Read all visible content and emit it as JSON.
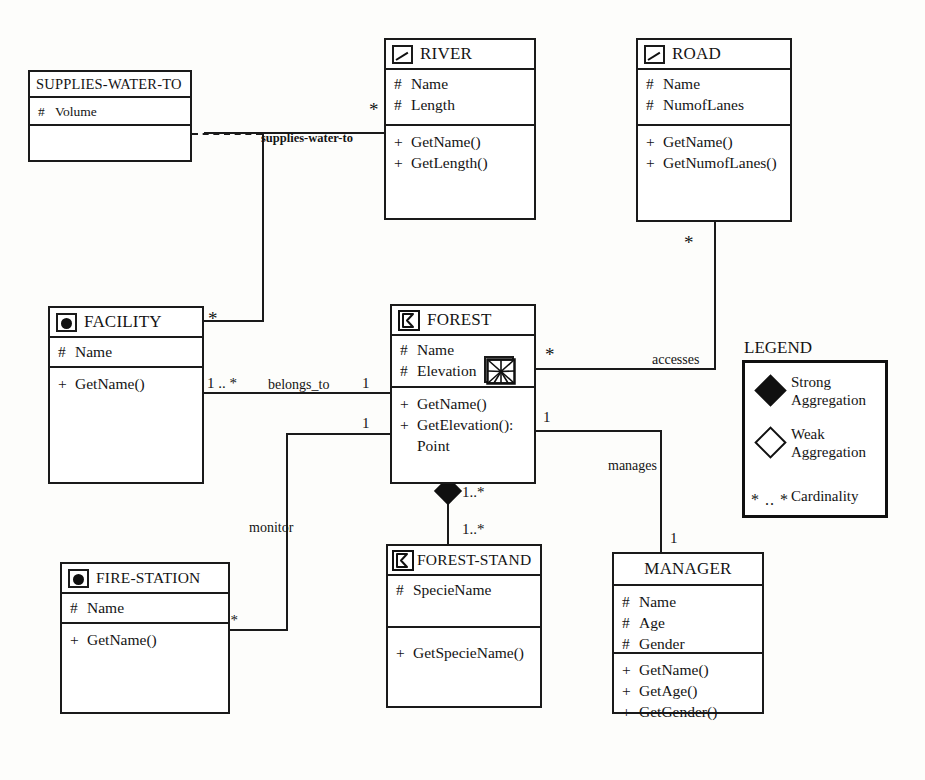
{
  "diagram": {
    "notation": "UML class diagram with spatial geometry stereotype icons"
  },
  "classes": {
    "supplies_water_to": {
      "name": "SUPPLIES-WATER-TO",
      "geometry_icon": "none",
      "attributes": [
        {
          "visibility": "#",
          "name": "Volume"
        }
      ],
      "operations": []
    },
    "river": {
      "name": "RIVER",
      "geometry_icon": "line-icon",
      "attributes": [
        {
          "visibility": "#",
          "name": "Name"
        },
        {
          "visibility": "#",
          "name": "Length"
        }
      ],
      "operations": [
        {
          "visibility": "+",
          "name": "GetName()"
        },
        {
          "visibility": "+",
          "name": "GetLength()"
        }
      ]
    },
    "road": {
      "name": "ROAD",
      "geometry_icon": "line-icon",
      "attributes": [
        {
          "visibility": "#",
          "name": "Name"
        },
        {
          "visibility": "#",
          "name": "NumofLanes"
        }
      ],
      "operations": [
        {
          "visibility": "+",
          "name": "GetName()"
        },
        {
          "visibility": "+",
          "name": "GetNumofLanes()"
        }
      ]
    },
    "facility": {
      "name": "FACILITY",
      "geometry_icon": "point-icon",
      "attributes": [
        {
          "visibility": "#",
          "name": "Name"
        }
      ],
      "operations": [
        {
          "visibility": "+",
          "name": "GetName()"
        }
      ]
    },
    "forest": {
      "name": "FOREST",
      "geometry_icon": "polygon-icon",
      "attributes": [
        {
          "visibility": "#",
          "name": "Name"
        },
        {
          "visibility": "#",
          "name": "Elevation",
          "geometry_icon": "tin-icon"
        }
      ],
      "operations": [
        {
          "visibility": "+",
          "name": "GetName()"
        },
        {
          "visibility": "+",
          "name": "GetElevation():"
        },
        {
          "visibility": "",
          "name": "Point"
        }
      ]
    },
    "fire_station": {
      "name": "FIRE-STATION",
      "geometry_icon": "point-icon",
      "attributes": [
        {
          "visibility": "#",
          "name": "Name"
        }
      ],
      "operations": [
        {
          "visibility": "+",
          "name": "GetName()"
        }
      ]
    },
    "forest_stand": {
      "name": "FOREST-STAND",
      "geometry_icon": "polygon-icon",
      "attributes": [
        {
          "visibility": "#",
          "name": "SpecieName"
        }
      ],
      "operations": [
        {
          "visibility": "+",
          "name": "GetSpecieName()"
        }
      ]
    },
    "manager": {
      "name": "MANAGER",
      "geometry_icon": "none",
      "attributes": [
        {
          "visibility": "#",
          "name": "Name"
        },
        {
          "visibility": "#",
          "name": "Age"
        },
        {
          "visibility": "#",
          "name": "Gender"
        }
      ],
      "operations": [
        {
          "visibility": "+",
          "name": "GetName()"
        },
        {
          "visibility": "+",
          "name": "GetAge()"
        },
        {
          "visibility": "+",
          "name": "GetGender()"
        }
      ]
    }
  },
  "associations": {
    "supplies_water_to": {
      "label": "supplies-water-to",
      "from": "FACILITY",
      "to": "RIVER",
      "from_cardinality": "*",
      "to_cardinality": "*",
      "association_class": "SUPPLIES-WATER-TO"
    },
    "belongs_to": {
      "label": "belongs_to",
      "from": "FACILITY",
      "to": "FOREST",
      "from_cardinality": "1 .. *",
      "to_cardinality": "1"
    },
    "accesses": {
      "label": "accesses",
      "from": "FOREST",
      "to": "ROAD",
      "from_cardinality": "*",
      "to_cardinality": "*"
    },
    "manages": {
      "label": "manages",
      "from": "FOREST",
      "to": "MANAGER",
      "from_cardinality": "1",
      "to_cardinality": "1"
    },
    "monitor": {
      "label": "monitor",
      "from": "FIRE-STATION",
      "to": "FOREST",
      "from_cardinality": "1 .. *",
      "to_cardinality": "1"
    },
    "aggregation": {
      "label": "",
      "from": "FOREST",
      "to": "FOREST-STAND",
      "from_cardinality": "1..*",
      "to_cardinality": "1..*",
      "type": "strong-aggregation"
    }
  },
  "legend": {
    "title": "LEGEND",
    "items": [
      {
        "symbol": "filled-diamond",
        "label_line1": "Strong",
        "label_line2": "Aggregation"
      },
      {
        "symbol": "open-diamond",
        "label_line1": "Weak",
        "label_line2": "Aggregation"
      },
      {
        "symbol": "* .. *",
        "label_line1": "Cardinality",
        "label_line2": ""
      }
    ]
  }
}
